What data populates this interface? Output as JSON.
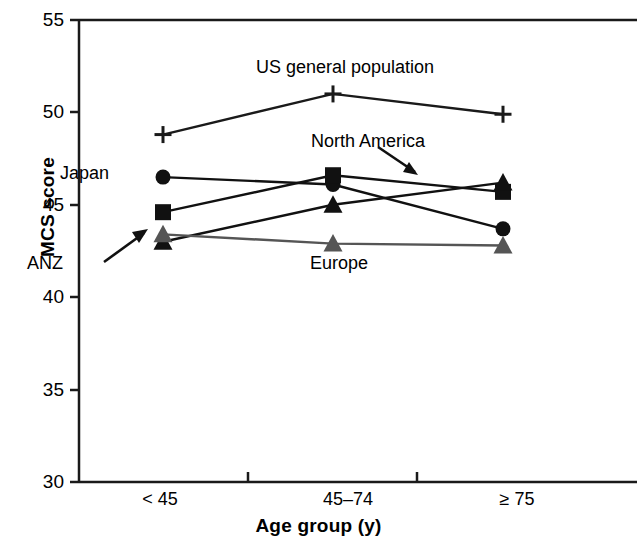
{
  "chart_data": {
    "type": "line",
    "title": "",
    "xlabel": "Age group (y)",
    "ylabel": "MCS score",
    "categories": [
      "< 45",
      "45–74",
      "≥ 75"
    ],
    "ylim": [
      30,
      55
    ],
    "yticks": [
      30,
      35,
      40,
      45,
      50,
      55
    ],
    "grid": false,
    "legend_position": "inline-annotations",
    "series": [
      {
        "name": "US general population",
        "marker": "plus",
        "color": "#1a1a1a",
        "values": [
          48.8,
          51.0,
          49.9
        ]
      },
      {
        "name": "Japan",
        "marker": "circle",
        "color": "#111111",
        "values": [
          46.5,
          46.1,
          43.7
        ]
      },
      {
        "name": "North America",
        "marker": "square",
        "color": "#111111",
        "values": [
          44.6,
          46.6,
          45.7
        ]
      },
      {
        "name": "ANZ",
        "marker": "triangle",
        "color": "#111111",
        "values": [
          43.0,
          45.0,
          46.2
        ]
      },
      {
        "name": "Europe",
        "marker": "triangle",
        "color": "#555555",
        "values": [
          43.4,
          42.9,
          42.8
        ]
      }
    ],
    "annotations": [
      {
        "text": "US general population",
        "arrow": false
      },
      {
        "text": "North America",
        "arrow": true
      },
      {
        "text": "Japan",
        "arrow": false
      },
      {
        "text": "ANZ",
        "arrow": true
      },
      {
        "text": "Europe",
        "arrow": false
      }
    ]
  },
  "axis": {
    "y_title": "MCS score",
    "x_title": "Age group (y)",
    "y_tick_labels": [
      "55",
      "50",
      "45",
      "40",
      "35",
      "30"
    ],
    "x_tick_labels": [
      "< 45",
      "45–74",
      "≥ 75"
    ]
  },
  "labels": {
    "us": "US general population",
    "north_america": "North America",
    "japan": "Japan",
    "anz": "ANZ",
    "europe": "Europe"
  }
}
